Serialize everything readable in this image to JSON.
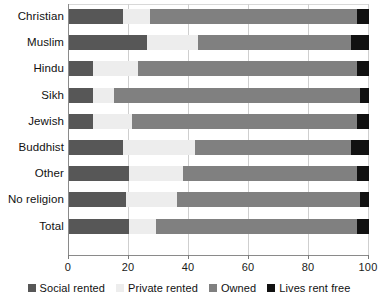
{
  "chart_data": {
    "type": "bar",
    "orientation": "horizontal",
    "stacked": true,
    "title": "",
    "xlabel": "",
    "ylabel": "",
    "xlim": [
      0,
      100
    ],
    "xticks": [
      0,
      20,
      40,
      60,
      80,
      100
    ],
    "grid": true,
    "legend_position": "bottom",
    "categories": [
      "Christian",
      "Muslim",
      "Hindu",
      "Sikh",
      "Jewish",
      "Buddhist",
      "Other",
      "No religion",
      "Total"
    ],
    "series": [
      {
        "name": "Social rented",
        "color": "#575757",
        "values": [
          18,
          26,
          8,
          8,
          8,
          18,
          20,
          19,
          20
        ]
      },
      {
        "name": "Private rented",
        "color": "#ededed",
        "values": [
          9,
          17,
          15,
          7,
          13,
          24,
          18,
          17,
          9
        ]
      },
      {
        "name": "Owned",
        "color": "#808080",
        "values": [
          69,
          51,
          73,
          82,
          75,
          52,
          58,
          61,
          67
        ]
      },
      {
        "name": "Lives rent free",
        "color": "#111111",
        "values": [
          4,
          6,
          4,
          3,
          4,
          6,
          4,
          3,
          4
        ]
      }
    ]
  },
  "axis": {
    "tick_labels": [
      "0",
      "20",
      "40",
      "60",
      "80",
      "100"
    ]
  },
  "legend": {
    "items": [
      {
        "label": "Social rented",
        "color": "#575757"
      },
      {
        "label": "Private rented",
        "color": "#ededed"
      },
      {
        "label": "Owned",
        "color": "#808080"
      },
      {
        "label": "Lives rent free",
        "color": "#111111"
      }
    ]
  }
}
